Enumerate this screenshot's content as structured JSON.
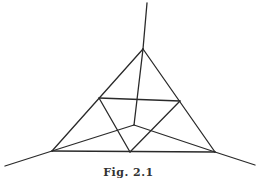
{
  "figure": {
    "caption": "Fig. 2.1",
    "stroke_color": "#2a2a2a",
    "points": {
      "top_end": [
        147,
        3
      ],
      "apex": [
        143,
        49
      ],
      "left": [
        52,
        151
      ],
      "right": [
        215,
        152
      ],
      "bottom_mid": [
        130,
        152
      ],
      "inner_left": [
        99,
        98
      ],
      "inner_right": [
        180,
        101
      ],
      "center": [
        134,
        125
      ],
      "left_end": [
        5,
        166
      ],
      "right_end": [
        255,
        165
      ]
    },
    "segments": [
      [
        "top_end",
        "apex"
      ],
      [
        "apex",
        "left"
      ],
      [
        "apex",
        "right"
      ],
      [
        "left",
        "right"
      ],
      [
        "inner_left",
        "inner_right"
      ],
      [
        "inner_left",
        "bottom_mid"
      ],
      [
        "inner_right",
        "bottom_mid"
      ],
      [
        "apex",
        "center"
      ],
      [
        "center",
        "left"
      ],
      [
        "center",
        "right"
      ],
      [
        "left_end",
        "left"
      ],
      [
        "right",
        "right_end"
      ]
    ]
  }
}
